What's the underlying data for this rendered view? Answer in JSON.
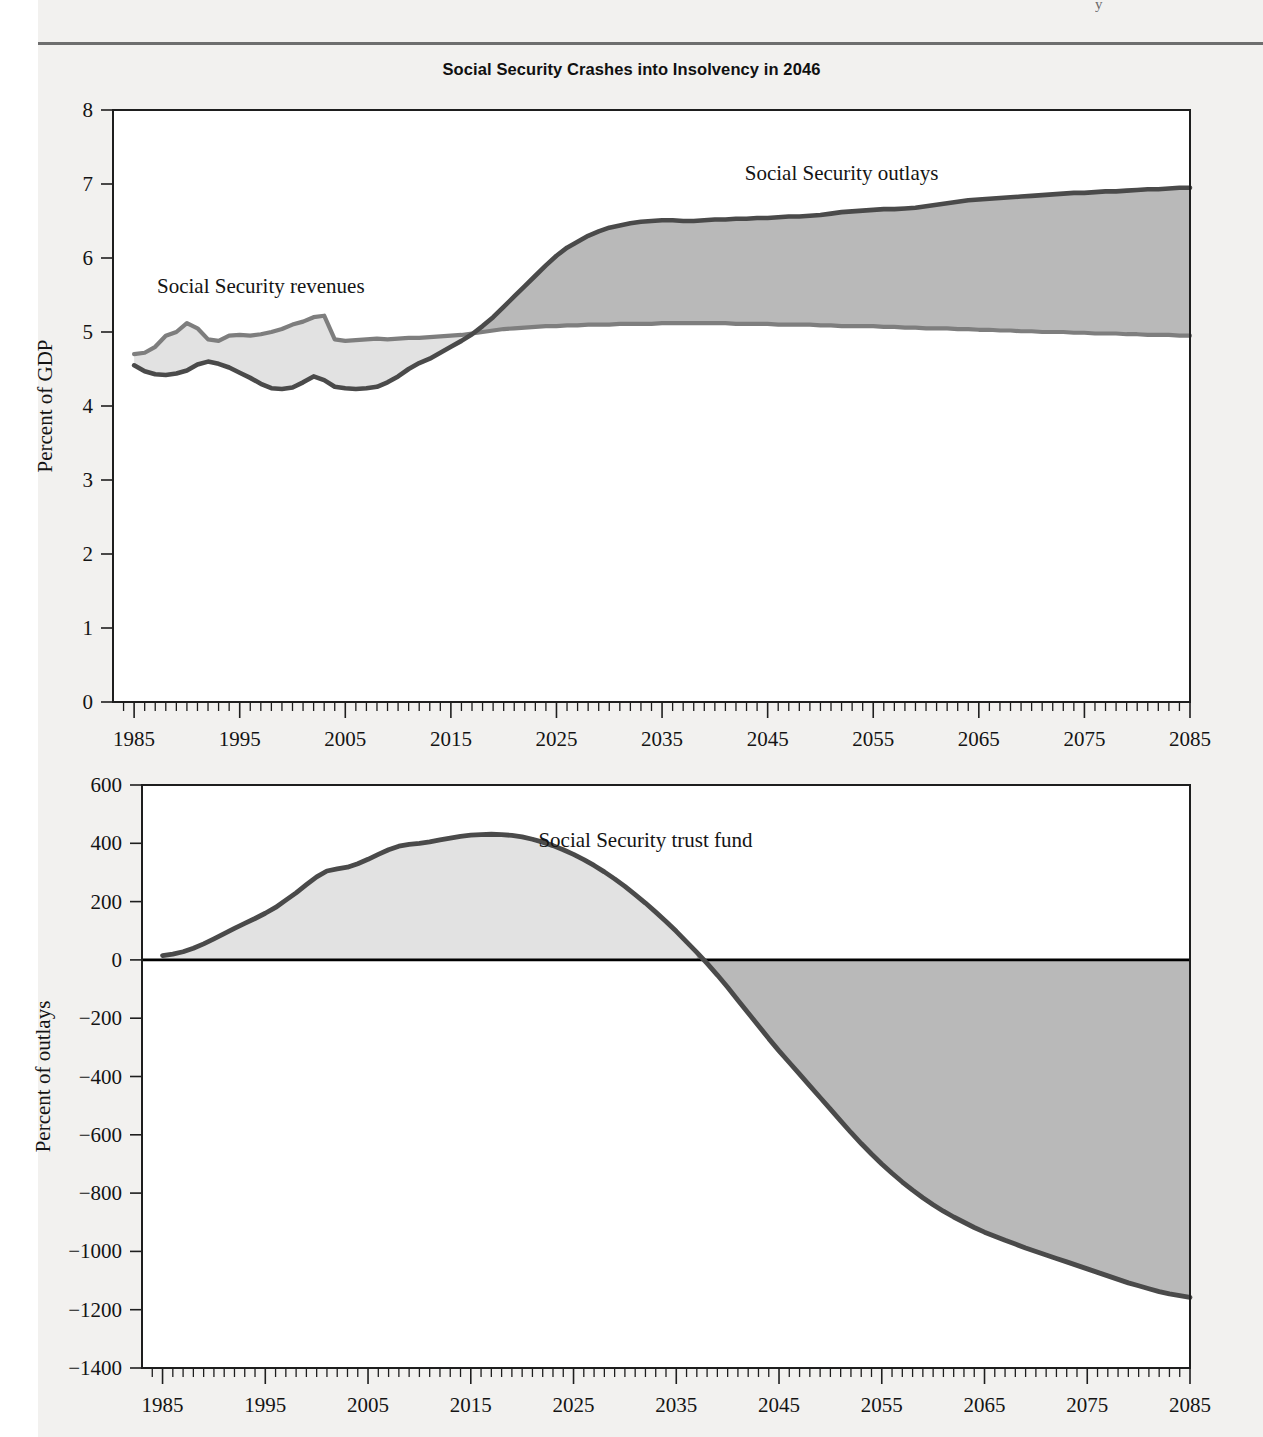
{
  "header_fragment": "y",
  "charts": [
    {
      "id": "top",
      "title": "Social Security Crashes into Insolvency in 2046",
      "ylabel": "Percent of GDP"
    },
    {
      "id": "bottom",
      "title": "",
      "ylabel": "Percent of outlays"
    }
  ],
  "labels": {
    "revenues": "Social Security revenues",
    "outlays": "Social Security outlays",
    "trust_fund": "Social Security trust fund"
  },
  "colors": {
    "outlays_line": "#4a4a4a",
    "revenues_line": "#7e7e7e",
    "fill_light": "#e2e2e2",
    "fill_dark": "#b9b9b9",
    "frame": "#1e1e1e",
    "page_bg": "#f2f1ef",
    "plot_bg": "#ffffff"
  },
  "chart_data": [
    {
      "type": "area",
      "title": "Social Security Crashes into Insolvency in 2046",
      "xlabel": "",
      "ylabel": "Percent of GDP",
      "xlim": [
        1983,
        2085
      ],
      "ylim": [
        0,
        8
      ],
      "yticks": [
        0,
        1,
        2,
        3,
        4,
        5,
        6,
        7,
        8
      ],
      "xticks": [
        1985,
        1995,
        2005,
        2015,
        2025,
        2035,
        2045,
        2055,
        2065,
        2075,
        2085
      ],
      "xtick_minor_step": 1,
      "grid": false,
      "legend": "inline-annotation",
      "x": [
        1985,
        1986,
        1987,
        1988,
        1989,
        1990,
        1991,
        1992,
        1993,
        1994,
        1995,
        1996,
        1997,
        1998,
        1999,
        2000,
        2001,
        2002,
        2003,
        2004,
        2005,
        2006,
        2007,
        2008,
        2009,
        2010,
        2011,
        2012,
        2013,
        2014,
        2015,
        2016,
        2017,
        2018,
        2019,
        2020,
        2021,
        2022,
        2023,
        2024,
        2025,
        2026,
        2027,
        2028,
        2029,
        2030,
        2031,
        2032,
        2033,
        2034,
        2035,
        2036,
        2037,
        2038,
        2039,
        2040,
        2041,
        2042,
        2043,
        2044,
        2045,
        2046,
        2047,
        2048,
        2049,
        2050,
        2051,
        2052,
        2053,
        2054,
        2055,
        2056,
        2057,
        2058,
        2059,
        2060,
        2061,
        2062,
        2063,
        2064,
        2065,
        2066,
        2067,
        2068,
        2069,
        2070,
        2071,
        2072,
        2073,
        2074,
        2075,
        2076,
        2077,
        2078,
        2079,
        2080,
        2081,
        2082,
        2083,
        2084,
        2085
      ],
      "series": [
        {
          "name": "Social Security revenues",
          "color": "#7e7e7e",
          "values": [
            4.7,
            4.72,
            4.8,
            4.95,
            5.0,
            5.12,
            5.05,
            4.9,
            4.88,
            4.95,
            4.96,
            4.95,
            4.97,
            5.0,
            5.04,
            5.1,
            5.14,
            5.2,
            5.22,
            4.9,
            4.88,
            4.89,
            4.9,
            4.91,
            4.9,
            4.91,
            4.92,
            4.92,
            4.93,
            4.94,
            4.95,
            4.96,
            4.98,
            5.0,
            5.02,
            5.04,
            5.05,
            5.06,
            5.07,
            5.08,
            5.08,
            5.09,
            5.09,
            5.1,
            5.1,
            5.1,
            5.11,
            5.11,
            5.11,
            5.11,
            5.12,
            5.12,
            5.12,
            5.12,
            5.12,
            5.12,
            5.12,
            5.11,
            5.11,
            5.11,
            5.11,
            5.1,
            5.1,
            5.1,
            5.1,
            5.09,
            5.09,
            5.08,
            5.08,
            5.08,
            5.08,
            5.07,
            5.07,
            5.06,
            5.06,
            5.05,
            5.05,
            5.05,
            5.04,
            5.04,
            5.03,
            5.03,
            5.02,
            5.02,
            5.01,
            5.01,
            5.0,
            5.0,
            5.0,
            4.99,
            4.99,
            4.98,
            4.98,
            4.98,
            4.97,
            4.97,
            4.96,
            4.96,
            4.96,
            4.95,
            4.95
          ]
        },
        {
          "name": "Social Security outlays",
          "color": "#4a4a4a",
          "values": [
            4.55,
            4.47,
            4.43,
            4.42,
            4.44,
            4.48,
            4.56,
            4.6,
            4.57,
            4.52,
            4.45,
            4.38,
            4.3,
            4.24,
            4.23,
            4.25,
            4.32,
            4.4,
            4.35,
            4.26,
            4.24,
            4.23,
            4.24,
            4.26,
            4.32,
            4.4,
            4.5,
            4.58,
            4.64,
            4.72,
            4.8,
            4.88,
            4.97,
            5.08,
            5.2,
            5.34,
            5.48,
            5.62,
            5.76,
            5.9,
            6.03,
            6.14,
            6.22,
            6.3,
            6.36,
            6.41,
            6.44,
            6.47,
            6.49,
            6.5,
            6.51,
            6.51,
            6.5,
            6.5,
            6.51,
            6.52,
            6.52,
            6.53,
            6.53,
            6.54,
            6.54,
            6.55,
            6.56,
            6.56,
            6.57,
            6.58,
            6.6,
            6.62,
            6.63,
            6.64,
            6.65,
            6.66,
            6.66,
            6.67,
            6.68,
            6.7,
            6.72,
            6.74,
            6.76,
            6.78,
            6.79,
            6.8,
            6.81,
            6.82,
            6.83,
            6.84,
            6.85,
            6.86,
            6.87,
            6.88,
            6.88,
            6.89,
            6.9,
            6.9,
            6.91,
            6.92,
            6.93,
            6.93,
            6.94,
            6.95,
            6.95
          ]
        }
      ],
      "annotations": [
        {
          "text": "Social Security revenues",
          "x": 1997,
          "y": 5.62
        },
        {
          "text": "Social Security outlays",
          "x": 2052,
          "y": 7.15
        }
      ]
    },
    {
      "type": "area",
      "title": "",
      "xlabel": "",
      "ylabel": "Percent of outlays",
      "xlim": [
        1983,
        2085
      ],
      "ylim": [
        -1400,
        600
      ],
      "yticks": [
        600,
        400,
        200,
        0,
        -200,
        -400,
        -600,
        -800,
        -1000,
        -1200,
        -1400
      ],
      "xticks": [
        1985,
        1995,
        2005,
        2015,
        2025,
        2035,
        2045,
        2055,
        2065,
        2075,
        2085
      ],
      "xtick_minor_step": 1,
      "grid": false,
      "zero_line": 0,
      "legend": "inline-annotation",
      "x": [
        1985,
        1986,
        1987,
        1988,
        1989,
        1990,
        1991,
        1992,
        1993,
        1994,
        1995,
        1996,
        1997,
        1998,
        1999,
        2000,
        2001,
        2002,
        2003,
        2004,
        2005,
        2006,
        2007,
        2008,
        2009,
        2010,
        2011,
        2012,
        2013,
        2014,
        2015,
        2016,
        2017,
        2018,
        2019,
        2020,
        2021,
        2022,
        2023,
        2024,
        2025,
        2026,
        2027,
        2028,
        2029,
        2030,
        2031,
        2032,
        2033,
        2034,
        2035,
        2036,
        2037,
        2038,
        2039,
        2040,
        2041,
        2042,
        2043,
        2044,
        2045,
        2046,
        2047,
        2048,
        2049,
        2050,
        2051,
        2052,
        2053,
        2054,
        2055,
        2056,
        2057,
        2058,
        2059,
        2060,
        2061,
        2062,
        2063,
        2064,
        2065,
        2066,
        2067,
        2068,
        2069,
        2070,
        2071,
        2072,
        2073,
        2074,
        2075,
        2076,
        2077,
        2078,
        2079,
        2080,
        2081,
        2082,
        2083,
        2084,
        2085
      ],
      "series": [
        {
          "name": "Social Security trust fund",
          "color": "#4a4a4a",
          "values": [
            15,
            20,
            28,
            40,
            55,
            72,
            90,
            108,
            125,
            142,
            160,
            180,
            205,
            230,
            258,
            285,
            305,
            312,
            318,
            330,
            345,
            362,
            378,
            390,
            396,
            400,
            405,
            412,
            418,
            424,
            428,
            430,
            431,
            430,
            427,
            422,
            414,
            404,
            392,
            378,
            362,
            344,
            324,
            302,
            278,
            252,
            224,
            195,
            164,
            132,
            98,
            62,
            26,
            -12,
            -52,
            -94,
            -138,
            -182,
            -226,
            -270,
            -312,
            -352,
            -392,
            -432,
            -472,
            -512,
            -552,
            -592,
            -630,
            -666,
            -700,
            -732,
            -762,
            -790,
            -816,
            -840,
            -862,
            -882,
            -900,
            -918,
            -934,
            -948,
            -962,
            -975,
            -988,
            -1000,
            -1012,
            -1024,
            -1036,
            -1048,
            -1060,
            -1072,
            -1084,
            -1096,
            -1108,
            -1118,
            -1128,
            -1138,
            -1146,
            -1152,
            -1158
          ]
        }
      ],
      "annotations": [
        {
          "text": "Social Security trust fund",
          "x": 2032,
          "y": 410
        }
      ]
    }
  ]
}
